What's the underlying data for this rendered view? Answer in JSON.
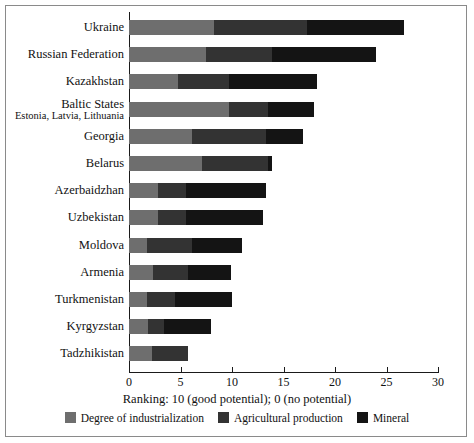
{
  "chart_data": {
    "type": "bar",
    "orientation": "horizontal",
    "stacked": true,
    "title": "",
    "xlabel": "Ranking: 10 (good potential); 0 (no potential)",
    "ylabel": "",
    "xlim": [
      0,
      30
    ],
    "xticks": [
      0,
      5,
      10,
      15,
      20,
      25,
      30
    ],
    "xtick_labels": [
      "0",
      "5",
      "10",
      "15",
      "20",
      "25",
      "30"
    ],
    "grid": false,
    "legend_position": "bottom",
    "categories": [
      "Ukraine",
      "Russian Federation",
      "Kazakhstan",
      "Baltic States",
      "Georgia",
      "Belarus",
      "Azerbaidzhan",
      "Uzbekistan",
      "Moldova",
      "Armenia",
      "Turkmenistan",
      "Kyrgyzstan",
      "Tadzhikistan"
    ],
    "category_sublabels": {
      "Baltic States": "Estonia, Latvia, Lithuania"
    },
    "series": [
      {
        "name": "Degree of industrialization",
        "color": "#6e6e6e",
        "values": [
          8.3,
          7.5,
          4.8,
          9.7,
          6.1,
          7.1,
          2.8,
          2.8,
          1.7,
          2.3,
          1.7,
          1.8,
          2.2
        ]
      },
      {
        "name": "Agricultural production",
        "color": "#333333",
        "values": [
          9.0,
          6.4,
          4.9,
          3.8,
          7.2,
          6.4,
          2.7,
          2.7,
          4.4,
          3.4,
          2.8,
          1.6,
          3.5
        ]
      },
      {
        "name": "Mineral",
        "color": "#141414",
        "values": [
          9.4,
          10.1,
          8.6,
          4.5,
          3.6,
          0.4,
          7.8,
          7.5,
          4.9,
          4.2,
          5.5,
          4.6,
          0.0
        ]
      }
    ],
    "totals": [
      26.7,
      24.0,
      18.3,
      18.0,
      16.9,
      13.9,
      13.3,
      13.0,
      11.0,
      9.9,
      10.0,
      8.0,
      5.7
    ]
  },
  "legend": {
    "items": [
      {
        "label": "Degree of industrialization",
        "color": "#6e6e6e"
      },
      {
        "label": "Agricultural production",
        "color": "#333333"
      },
      {
        "label": "Mineral",
        "color": "#141414"
      }
    ]
  },
  "colors": {
    "frame": "#8a8a8a",
    "axis": "#1a1a1a",
    "text": "#111111",
    "background": "#ffffff"
  }
}
